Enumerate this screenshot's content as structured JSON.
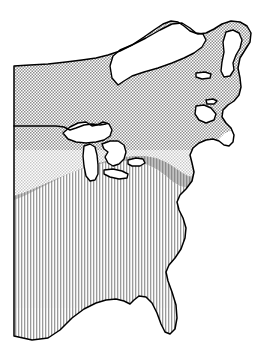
{
  "figure": {
    "type": "range-distribution-map",
    "region": "Eastern North America",
    "background_color": "#ffffff",
    "outline_color": "#000000",
    "width": 254,
    "height": 347
  },
  "legend_patterns": [
    {
      "id": "stipple",
      "name": "stipple-dot-fill",
      "description": "Fine dotted / stippled shading covering the northern and central portion of the range",
      "color": "#8f8f8f",
      "fill_rule": "dot-screen"
    },
    {
      "id": "vertical-hatch",
      "name": "vertical-line-fill",
      "description": "Vertical line hatching covering the southeastern portion of the range",
      "color": "#9a9a9a",
      "fill_rule": "vertical-lines"
    },
    {
      "id": "overlap",
      "name": "overlap-grey-fill",
      "description": "Solid grey band where the stipple and vertical hatch zones overlap",
      "color": "#b4b4b4",
      "fill_rule": "solid"
    },
    {
      "id": "unshaded",
      "name": "unshaded-white",
      "description": "Land and water outside the shaded range, left white",
      "color": "#ffffff",
      "fill_rule": "none"
    }
  ],
  "map_features": [
    {
      "name": "hudson-bay",
      "kind": "water-body",
      "fill": "#ffffff"
    },
    {
      "name": "lake-superior",
      "kind": "water-body",
      "fill": "#ffffff"
    },
    {
      "name": "lake-michigan",
      "kind": "water-body",
      "fill": "#ffffff"
    },
    {
      "name": "lake-huron",
      "kind": "water-body",
      "fill": "#ffffff"
    },
    {
      "name": "lake-erie",
      "kind": "water-body",
      "fill": "#ffffff"
    },
    {
      "name": "lake-ontario",
      "kind": "water-body",
      "fill": "#ffffff"
    },
    {
      "name": "newfoundland",
      "kind": "island",
      "fill": "#ffffff"
    },
    {
      "name": "nova-scotia",
      "kind": "peninsula",
      "fill": "#ffffff"
    },
    {
      "name": "prince-edward-island",
      "kind": "island",
      "fill": "#ffffff"
    },
    {
      "name": "anticosti-island",
      "kind": "island",
      "fill": "#ffffff"
    },
    {
      "name": "florida-peninsula",
      "kind": "peninsula",
      "fill": "vertical-hatch"
    },
    {
      "name": "gulf-of-mexico-coast",
      "kind": "coastline",
      "fill": "#ffffff"
    },
    {
      "name": "atlantic-coast",
      "kind": "coastline",
      "fill": "#ffffff"
    },
    {
      "name": "us-canada-border",
      "kind": "political-border",
      "fill": "none"
    },
    {
      "name": "western-crop-edge",
      "kind": "map-crop-edge",
      "fill": "none"
    }
  ]
}
